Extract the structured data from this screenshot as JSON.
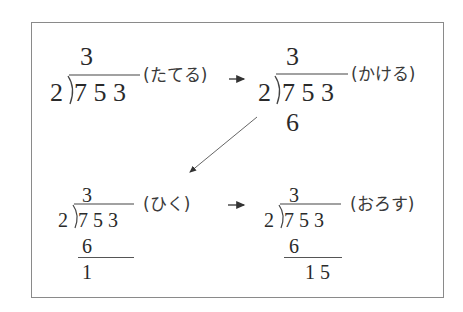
{
  "steps": [
    {
      "quotient": "3",
      "divisor": "2",
      "dividend": "7 5 3",
      "label": "(たてる)",
      "product": "",
      "remainder": ""
    },
    {
      "quotient": "3",
      "divisor": "2",
      "dividend": "7 5 3",
      "label": "(かける)",
      "product": "6",
      "remainder": ""
    },
    {
      "quotient": "3",
      "divisor": "2",
      "dividend": "7 5 3",
      "label": "(ひく)",
      "product": "6",
      "remainder": "1"
    },
    {
      "quotient": "3",
      "divisor": "2",
      "dividend": "7 5 3",
      "label": "(おろす)",
      "product": "6",
      "remainder": "1 5"
    }
  ],
  "arrows": [
    "right",
    "diagonal-down-left",
    "right"
  ],
  "colors": {
    "text": "#2a2a2a",
    "border": "#8a8a8a",
    "arrow": "#555555"
  }
}
